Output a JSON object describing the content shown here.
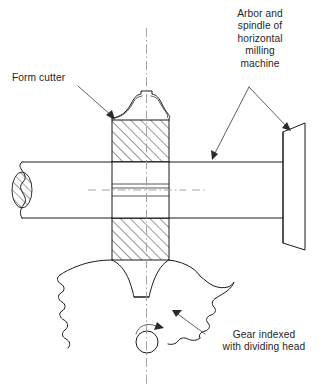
{
  "figure": {
    "background_color": "#ffffff",
    "line_color": "#1a1a1a",
    "centerline_color": "#9a9a9a",
    "leader_color": "#3a3a3a",
    "width": 322,
    "height": 391
  },
  "labels": {
    "form_cutter": "Form cutter",
    "arbor_spindle": "Arbor and\nspindle of\nhorizontal\nmilling\nmachine",
    "gear_indexed": "Gear indexed\nwith dividing head"
  },
  "parts": {
    "form_cutter_name": "form-cutter",
    "arbor_name": "arbor-shaft",
    "spindle_nose_name": "spindle-nose",
    "gear_blank_name": "gear-blank",
    "gear_center_name": "gear-center-hole",
    "rotation_arrow_name": "gear-rotation-arrow",
    "vertical_centerline_name": "vertical-centerline",
    "horizontal_centerline_name": "arbor-centerline"
  }
}
